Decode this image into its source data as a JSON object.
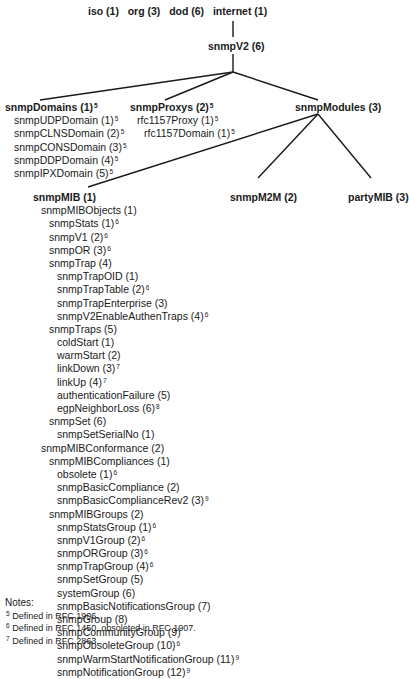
{
  "top_path": [
    {
      "label": "iso (1)"
    },
    {
      "label": "org (3)"
    },
    {
      "label": "dod (6)"
    },
    {
      "label": "internet (1)"
    }
  ],
  "snmpV2": {
    "label": "snmpV2 (6)"
  },
  "snmpDomains": {
    "label": "snmpDomains (1)",
    "note": "5",
    "children": [
      {
        "label": "snmpUDPDomain (1)",
        "note": "5"
      },
      {
        "label": "snmpCLNSDomain (2)",
        "note": "5"
      },
      {
        "label": "snmpCONSDomain (3)",
        "note": "5"
      },
      {
        "label": "snmpDDPDomain (4)",
        "note": "5"
      },
      {
        "label": "snmpIPXDomain (5)",
        "note": "5"
      }
    ]
  },
  "snmpProxys": {
    "label": "snmpProxys (2)",
    "note": "5",
    "children": [
      {
        "label": "rfc1157Proxy (1)",
        "note": "5"
      },
      {
        "label": "rfc1157Domain (1)",
        "note": "5"
      }
    ]
  },
  "snmpModules": {
    "label": "snmpModules (3)"
  },
  "snmpM2M": {
    "label": "snmpM2M (2)"
  },
  "partyMIB": {
    "label": "partyMIB (3)"
  },
  "snmpMIB": {
    "label": "snmpMIB (1)",
    "rows": [
      {
        "indent": 1,
        "label": "snmpMIBObjects (1)",
        "note": ""
      },
      {
        "indent": 2,
        "label": "snmpStats (1)",
        "note": "6"
      },
      {
        "indent": 2,
        "label": "snmpV1 (2)",
        "note": "6"
      },
      {
        "indent": 2,
        "label": "snmpOR (3)",
        "note": "6"
      },
      {
        "indent": 2,
        "label": "snmpTrap (4)",
        "note": ""
      },
      {
        "indent": 3,
        "label": "snmpTrapOID (1)",
        "note": ""
      },
      {
        "indent": 3,
        "label": "snmpTrapTable (2)",
        "note": "6"
      },
      {
        "indent": 3,
        "label": "snmpTrapEnterprise (3)",
        "note": ""
      },
      {
        "indent": 3,
        "label": "snmpV2EnableAuthenTraps (4)",
        "note": "6"
      },
      {
        "indent": 2,
        "label": "snmpTraps (5)",
        "note": ""
      },
      {
        "indent": 3,
        "label": "coldStart (1)",
        "note": ""
      },
      {
        "indent": 3,
        "label": "warmStart (2)",
        "note": ""
      },
      {
        "indent": 3,
        "label": "linkDown (3)",
        "note": "7"
      },
      {
        "indent": 3,
        "label": "linkUp (4)",
        "note": "7"
      },
      {
        "indent": 3,
        "label": "authenticationFailure (5)",
        "note": ""
      },
      {
        "indent": 3,
        "label": "egpNeighborLoss (6)",
        "note": "8"
      },
      {
        "indent": 2,
        "label": "snmpSet (6)",
        "note": ""
      },
      {
        "indent": 3,
        "label": "snmpSetSerialNo (1)",
        "note": ""
      },
      {
        "indent": 1,
        "label": "snmpMIBConformance (2)",
        "note": ""
      },
      {
        "indent": 2,
        "label": "snmpMIBCompliances (1)",
        "note": ""
      },
      {
        "indent": 3,
        "label": "obsolete (1)",
        "note": "6"
      },
      {
        "indent": 3,
        "label": "snmpBasicCompliance (2)",
        "note": ""
      },
      {
        "indent": 3,
        "label": "snmpBasicComplianceRev2 (3)",
        "note": "9"
      },
      {
        "indent": 2,
        "label": "snmpMIBGroups (2)",
        "note": ""
      },
      {
        "indent": 3,
        "label": "snmpStatsGroup (1)",
        "note": "6"
      },
      {
        "indent": 3,
        "label": "snmpV1Group (2)",
        "note": "6"
      },
      {
        "indent": 3,
        "label": "snmpORGroup (3)",
        "note": "6"
      },
      {
        "indent": 3,
        "label": "snmpTrapGroup (4)",
        "note": "6"
      },
      {
        "indent": 3,
        "label": "snmpSetGroup (5)",
        "note": ""
      },
      {
        "indent": 3,
        "label": "systemGroup (6)",
        "note": ""
      },
      {
        "indent": 3,
        "label": "snmpBasicNotificationsGroup (7)",
        "note": ""
      },
      {
        "indent": 3,
        "label": "snmpGroup (8)",
        "note": ""
      },
      {
        "indent": 3,
        "label": "snmpCommunityGroup (9)",
        "note": ""
      },
      {
        "indent": 3,
        "label": "snmpObsoleteGroup (10)",
        "note": "6"
      },
      {
        "indent": 3,
        "label": "snmpWarmStartNotificationGroup (11)",
        "note": "9"
      },
      {
        "indent": 3,
        "label": "snmpNotificationGroup (12)",
        "note": "9"
      }
    ]
  },
  "notes": {
    "title": "Notes:",
    "items": [
      {
        "mark": "5",
        "text": "Defined in RFC 1906."
      },
      {
        "mark": "6",
        "text": "Defined in RFC 1450, obsoleted in RFC 1907."
      },
      {
        "mark": "7",
        "text": "Defined in RFC 2863."
      }
    ]
  }
}
